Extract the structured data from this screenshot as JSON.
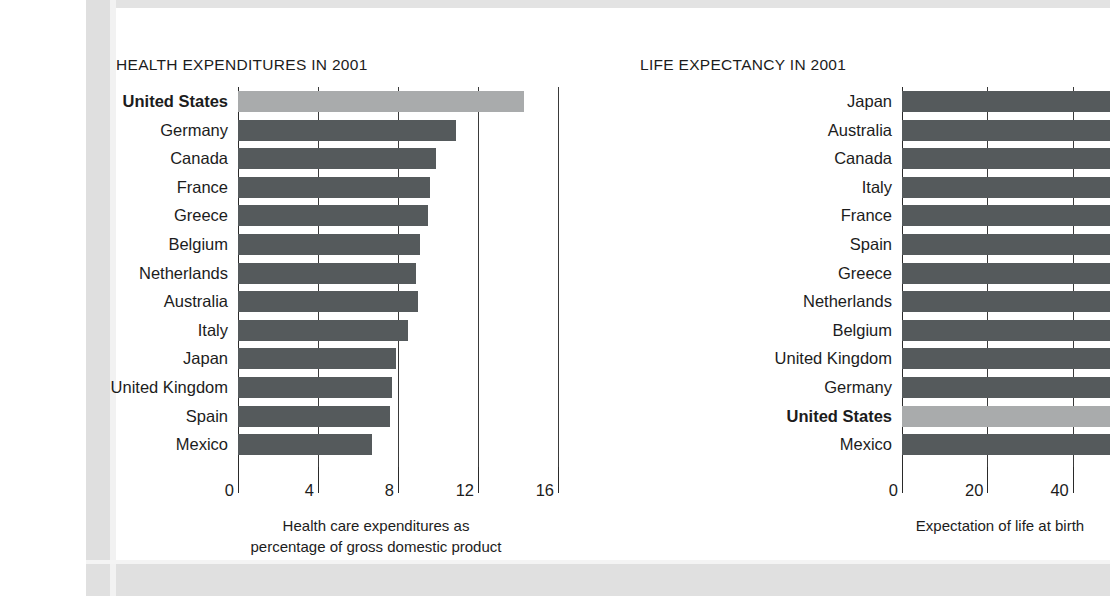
{
  "page": {
    "background_color": "#ffffff",
    "frame_color": "#dfdfdf",
    "panel_color": "#ffffff"
  },
  "colors": {
    "bar_default": "#555a5c",
    "bar_highlight": "#a9abac",
    "text": "#1c1c1c",
    "axis": "#2a2a2a",
    "grid": "#3a3a3a"
  },
  "chart_data": [
    {
      "id": "health-expenditures",
      "type": "bar",
      "orientation": "horizontal",
      "title": "HEALTH EXPENDITURES IN 2001",
      "xlabel": "Health care expenditures as percentage of gross domestic product",
      "xlabel_line1": "Health care expenditures as",
      "xlabel_line2": "percentage of gross domestic product",
      "ylabel": "",
      "xlim": [
        0,
        16
      ],
      "xticks": [
        0,
        4,
        8,
        12,
        16
      ],
      "xticklabels": [
        "0",
        "4",
        "8",
        "12",
        "16"
      ],
      "grid": true,
      "grid_values": [
        4,
        8,
        12,
        16
      ],
      "legend": "none",
      "highlight_category": "United States",
      "categories": [
        "United States",
        "Germany",
        "Canada",
        "France",
        "Greece",
        "Belgium",
        "Netherlands",
        "Australia",
        "Italy",
        "Japan",
        "United Kingdom",
        "Spain",
        "Mexico"
      ],
      "values": [
        14.3,
        10.9,
        9.9,
        9.6,
        9.5,
        9.1,
        8.9,
        9.0,
        8.5,
        7.9,
        7.7,
        7.6,
        6.7
      ],
      "clipped_at_right_edge": false
    },
    {
      "id": "life-expectancy",
      "type": "bar",
      "orientation": "horizontal",
      "title": "LIFE EXPECTANCY IN 2001",
      "xlabel": "Expectation of life at birth",
      "ylabel": "",
      "xlim": [
        0,
        80
      ],
      "xticks": [
        0,
        20,
        40,
        60,
        80
      ],
      "xticklabels": [
        "0",
        "20",
        "40",
        "60",
        "80"
      ],
      "grid": true,
      "grid_values": [
        20,
        40,
        60,
        80
      ],
      "legend": "none",
      "highlight_category": "United States",
      "note": "all bars except Mexico extend past the right edge of the screenshot (chart is cropped)",
      "categories": [
        "Japan",
        "Australia",
        "Canada",
        "Italy",
        "France",
        "Spain",
        "Greece",
        "Netherlands",
        "Belgium",
        "United Kingdom",
        "Germany",
        "United States",
        "Mexico"
      ],
      "values": [
        81.5,
        80.0,
        79.5,
        79.5,
        79.0,
        79.0,
        78.5,
        78.5,
        78.0,
        78.0,
        78.0,
        77.0,
        69.5
      ],
      "clipped_at_right_edge": true
    }
  ]
}
